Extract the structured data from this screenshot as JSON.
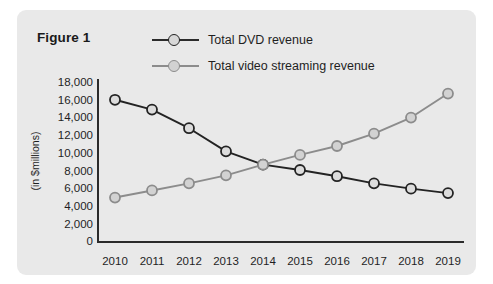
{
  "figure": {
    "title": "Figure 1"
  },
  "legend": {
    "position": "top-right",
    "entries": [
      {
        "label": "Total DVD revenue",
        "color": "#232323",
        "icon": "line-marker-icon"
      },
      {
        "label": "Total video streaming revenue",
        "color": "#8c8c8c",
        "icon": "line-marker-icon"
      }
    ]
  },
  "axes": {
    "ylabel": "(in $millions)",
    "yticks": [
      "18,000",
      "16,000",
      "14,000",
      "12,000",
      "10,000",
      "8,000",
      "6,000",
      "4,000",
      "2,000",
      "0"
    ],
    "xticks": [
      "2010",
      "2011",
      "2012",
      "2013",
      "2014",
      "2015",
      "2016",
      "2017",
      "2018",
      "2019"
    ]
  },
  "chart_data": {
    "type": "line",
    "title": "Figure 1",
    "xlabel": "",
    "ylabel": "(in $millions)",
    "ylim": [
      0,
      18000
    ],
    "ytick_step": 2000,
    "grid": false,
    "legend_position": "top-right",
    "categories": [
      "2010",
      "2011",
      "2012",
      "2013",
      "2014",
      "2015",
      "2016",
      "2017",
      "2018",
      "2019"
    ],
    "series": [
      {
        "name": "Total DVD revenue",
        "color": "#232323",
        "values": [
          16000,
          14900,
          12800,
          10200,
          8700,
          8100,
          7400,
          6600,
          6000,
          5500
        ]
      },
      {
        "name": "Total video streaming revenue",
        "color": "#8c8c8c",
        "values": [
          5000,
          5800,
          6600,
          7500,
          8700,
          9800,
          10800,
          12200,
          14000,
          16700
        ]
      }
    ],
    "annotations": [
      "Lines cross at 2014 at approximately 8,700"
    ]
  }
}
